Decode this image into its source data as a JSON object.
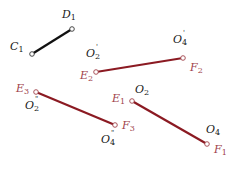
{
  "diagram": {
    "colors": {
      "black_segment": "#111111",
      "red_segment": "#8b1a22",
      "black_label": "#1a1a1a",
      "red_label": "#a0424a",
      "endpoint_fill": "#ffffff"
    },
    "segments": [
      {
        "id": "C1D1",
        "from": [
          32,
          54
        ],
        "to": [
          72,
          29
        ],
        "color": "black"
      },
      {
        "id": "E2F2",
        "from": [
          96,
          72
        ],
        "to": [
          183,
          58
        ],
        "color": "red"
      },
      {
        "id": "E3F3",
        "from": [
          36,
          92
        ],
        "to": [
          115,
          125
        ],
        "color": "red"
      },
      {
        "id": "E1F1",
        "from": [
          132,
          101
        ],
        "to": [
          207,
          144
        ],
        "color": "red"
      }
    ],
    "labels": {
      "C1": {
        "base": "C",
        "sub": "1",
        "prime": ""
      },
      "D1": {
        "base": "D",
        "sub": "1",
        "prime": ""
      },
      "O2p": {
        "base": "O",
        "sub": "2",
        "prime": "'"
      },
      "O4p": {
        "base": "O",
        "sub": "4",
        "prime": "'"
      },
      "E2": {
        "base": "E",
        "sub": "2",
        "prime": ""
      },
      "F2": {
        "base": "F",
        "sub": "2",
        "prime": ""
      },
      "E3": {
        "base": "E",
        "sub": "3",
        "prime": ""
      },
      "O2pp": {
        "base": "O",
        "sub": "2",
        "prime": "\""
      },
      "E1": {
        "base": "E",
        "sub": "1",
        "prime": ""
      },
      "O2": {
        "base": "O",
        "sub": "2",
        "prime": ""
      },
      "F3": {
        "base": "F",
        "sub": "3",
        "prime": ""
      },
      "O4pp": {
        "base": "O",
        "sub": "4",
        "prime": "\""
      },
      "O4": {
        "base": "O",
        "sub": "4",
        "prime": ""
      },
      "F1": {
        "base": "F",
        "sub": "1",
        "prime": ""
      }
    }
  }
}
